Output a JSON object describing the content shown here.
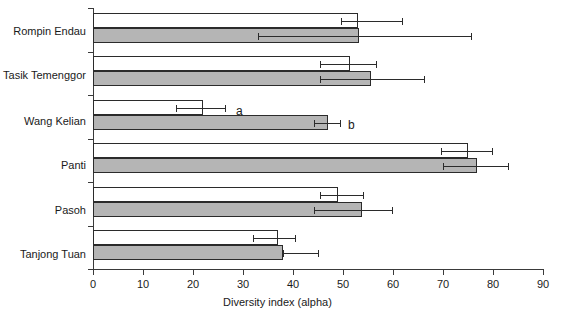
{
  "chart_data": {
    "type": "bar",
    "orientation": "horizontal",
    "title": "",
    "xlabel": "Diversity index (alpha)",
    "ylabel": "",
    "xlim": [
      0,
      90
    ],
    "xticks": [
      0,
      10,
      20,
      30,
      40,
      50,
      60,
      70,
      80,
      90
    ],
    "grid": false,
    "legend": "none",
    "categories": [
      "Rompin Endau",
      "Tasik Temenggor",
      "Wang Kelian",
      "Panti",
      "Pasoh",
      "Tanjong Tuan"
    ],
    "series": [
      {
        "name": "white",
        "color": "#ffffff",
        "values": [
          53.0,
          51.4,
          22.0,
          75.0,
          49.0,
          37.0
        ],
        "err_low": [
          49.5,
          45.4,
          16.6,
          69.5,
          45.4,
          32.0
        ],
        "err_high": [
          61.8,
          56.6,
          26.4,
          79.8,
          54.0,
          40.4
        ]
      },
      {
        "name": "gray",
        "color": "#b5b5b5",
        "values": [
          53.2,
          55.6,
          47.0,
          76.8,
          53.8,
          38.0
        ],
        "err_low": [
          33.0,
          45.4,
          44.2,
          70.0,
          44.2,
          38.0
        ],
        "err_high": [
          75.6,
          66.2,
          49.4,
          83.0,
          59.8,
          45.0
        ]
      }
    ],
    "annotations": [
      {
        "text": "a",
        "category": "Wang Kelian",
        "series": "white",
        "x": 29.0
      },
      {
        "text": "b",
        "category": "Wang Kelian",
        "series": "gray",
        "x": 51.4
      }
    ],
    "tick_labels": [
      "0",
      "10",
      "20",
      "30",
      "40",
      "50",
      "60",
      "70",
      "80",
      "90"
    ]
  },
  "axis": {
    "x_title": "Diversity index (alpha)"
  }
}
